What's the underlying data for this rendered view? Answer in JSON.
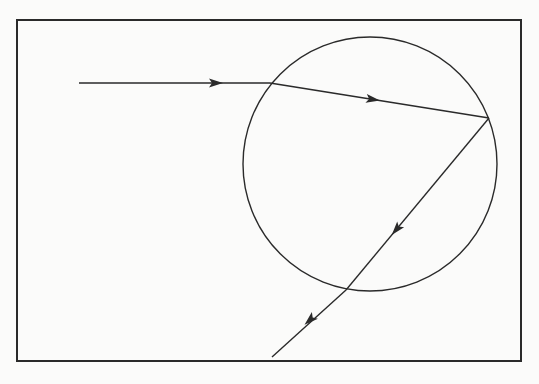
{
  "diagram": {
    "type": "light ray path through a circular droplet (refraction and internal reflection)",
    "colors": {
      "background": "#fbfbfa",
      "stroke": "#2a2a2a"
    },
    "frame": {
      "x": 17,
      "y": 20,
      "width": 504,
      "height": 341
    },
    "circle": {
      "cx": 370,
      "cy": 164,
      "r": 127
    },
    "rays": [
      {
        "id": "incident",
        "from": [
          79,
          83
        ],
        "to": [
          270,
          83
        ],
        "arrow_at": [
          221,
          83
        ]
      },
      {
        "id": "refracted-inside",
        "from": [
          270,
          83
        ],
        "to": [
          489,
          118
        ],
        "arrow_at": [
          378,
          100
        ]
      },
      {
        "id": "reflected-inside",
        "from": [
          489,
          118
        ],
        "to": [
          346,
          290
        ],
        "arrow_at": [
          394,
          232
        ]
      },
      {
        "id": "exiting",
        "from": [
          346,
          290
        ],
        "to": [
          272,
          357
        ],
        "arrow_at": [
          307,
          322
        ]
      }
    ],
    "points": {
      "entry": [
        270,
        83
      ],
      "reflection": [
        489,
        118
      ],
      "exit": [
        346,
        290
      ]
    }
  }
}
